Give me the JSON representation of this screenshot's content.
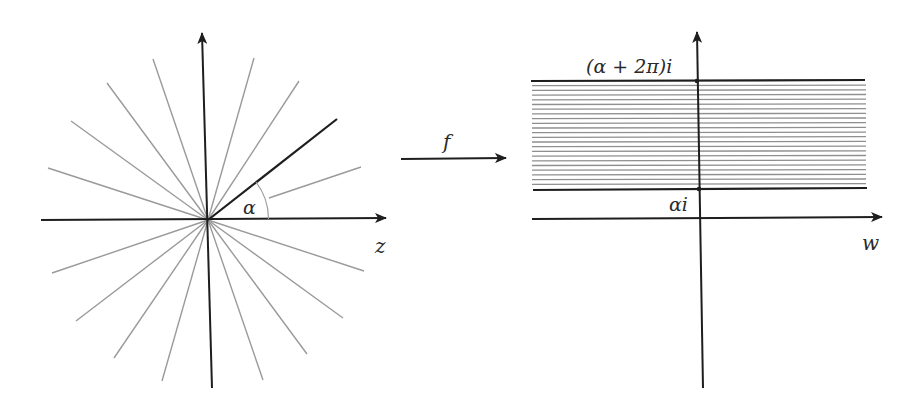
{
  "figure": {
    "colors": {
      "axis": "#1e1e1e",
      "ray": "#9a9a9a",
      "highlight_ray": "#1e1e1e",
      "hatch": "#8f8f8f",
      "label": "#2a2a2a"
    }
  },
  "left_panel": {
    "plane_label": "z",
    "angle_label": "α",
    "center": [
      208,
      220
    ],
    "gray_rays": [
      [
        48,
        168
      ],
      [
        71,
        121
      ],
      [
        107,
        83
      ],
      [
        153,
        59
      ],
      [
        254,
        58
      ],
      [
        299,
        81
      ],
      [
        52,
        273
      ],
      [
        76,
        321
      ],
      [
        114,
        358
      ],
      [
        162,
        381
      ],
      [
        364,
        271
      ],
      [
        343,
        318
      ],
      [
        307,
        354
      ],
      [
        263,
        380
      ]
    ],
    "partial_ray": {
      "from": [
        269,
        198
      ],
      "to": [
        361,
        167
      ]
    },
    "highlight_ray_end": [
      337,
      119
    ]
  },
  "map_arrow": {
    "label": "f"
  },
  "right_panel": {
    "plane_label": "w",
    "upper_boundary_label": "(α + 2π)i",
    "lower_boundary_label": "αi",
    "hatch_line_count": 22
  }
}
